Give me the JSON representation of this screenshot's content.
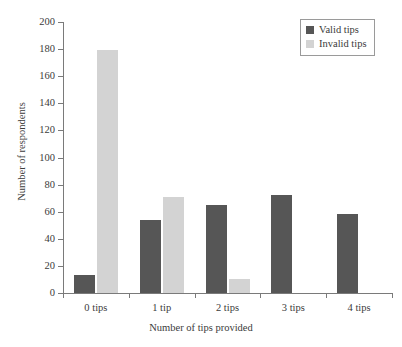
{
  "chart_data": {
    "type": "bar",
    "title": "",
    "subtitle": "",
    "xlabel": "Number of tips provided",
    "ylabel": "Number of respondents",
    "categories": [
      "0 tips",
      "1 tip",
      "2 tips",
      "3 tips",
      "4 tips"
    ],
    "series": [
      {
        "name": "Valid tips",
        "color": "#565656",
        "values": [
          13,
          54,
          65,
          72,
          58
        ]
      },
      {
        "name": "Invalid tips",
        "color": "#d3d3d3",
        "values": [
          179,
          71,
          10,
          0,
          0
        ]
      }
    ],
    "ylim": [
      0,
      200
    ],
    "yticks": [
      0,
      20,
      40,
      60,
      80,
      100,
      120,
      140,
      160,
      180,
      200
    ],
    "ytick_labels": [
      "0",
      "20",
      "40",
      "60",
      "80",
      "100",
      "120",
      "140",
      "160",
      "180",
      "200"
    ],
    "grid": false,
    "legend_position": "top-right",
    "legend": [
      {
        "label": "Valid tips",
        "color": "#565656"
      },
      {
        "label": "Invalid tips",
        "color": "#d3d3d3"
      }
    ],
    "axis_color": "#7a7a7a",
    "background": "#ffffff"
  }
}
